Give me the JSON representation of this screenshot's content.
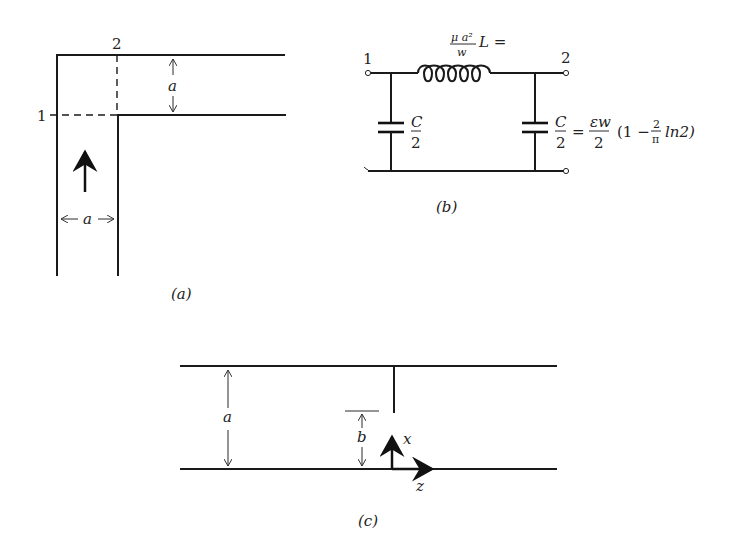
{
  "figure_a": {
    "caption": "(a)",
    "port_1_label": "1",
    "port_2_label": "2",
    "dim_height_label": "a",
    "dim_width_label": "a"
  },
  "figure_b": {
    "caption": "(b)",
    "port_1_label": "1",
    "port_2_label": "2",
    "inductor": {
      "lhs": "L =",
      "numerator": "μ a²",
      "denominator": "w"
    },
    "left_cap": {
      "numerator": "C",
      "denominator": "2"
    },
    "right_cap": {
      "numerator": "C",
      "denominator": "2",
      "equals": "=",
      "rhs_numerator": "εw",
      "rhs_denominator": "2",
      "paren_open": "(1 −",
      "frac_num": "2",
      "frac_den": "π",
      "paren_close": "ln2)"
    }
  },
  "figure_c": {
    "caption": "(c)",
    "dim_height_label": "a",
    "dim_post_gap_label": "b",
    "axis_x_label": "x",
    "axis_z_label": "z"
  }
}
